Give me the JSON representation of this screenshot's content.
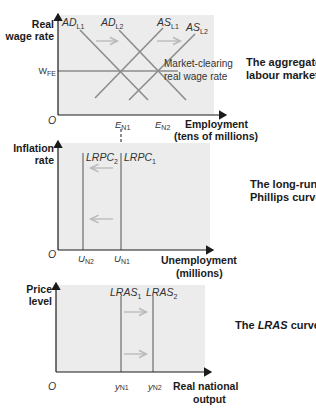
{
  "panels": [
    {
      "title_lines": [
        "The aggregate",
        "labour market"
      ],
      "y_axis_label": [
        "Real",
        "wage rate"
      ],
      "x_axis_label": [
        "Employment",
        "(tens of millions)"
      ],
      "origin": "O",
      "y_tick": {
        "main": "W",
        "sub": "FE"
      },
      "x_ticks": [
        {
          "main": "E",
          "sub": "N1"
        },
        {
          "main": "E",
          "sub": "N2"
        }
      ],
      "curves": [
        {
          "main": "AD",
          "sub": "L1"
        },
        {
          "main": "AD",
          "sub": "L2"
        },
        {
          "main": "AS",
          "sub": "L1"
        },
        {
          "main": "AS",
          "sub": "L2"
        }
      ],
      "annotation": [
        "Market-clearing",
        "real wage rate"
      ]
    },
    {
      "title_lines": [
        "The long-run",
        "Phillips curve"
      ],
      "y_axis_label": [
        "Inflation",
        "rate"
      ],
      "x_axis_label": [
        "Unemployment",
        "(millions)"
      ],
      "origin": "O",
      "x_ticks": [
        {
          "main": "U",
          "sub": "N2"
        },
        {
          "main": "U",
          "sub": "N1"
        }
      ],
      "curves": [
        {
          "main": "LRPC",
          "sub": "2"
        },
        {
          "main": "LRPC",
          "sub": "1"
        }
      ]
    },
    {
      "title_lines": [
        "The ",
        "LRAS",
        " curve"
      ],
      "y_axis_label": [
        "Price",
        "level"
      ],
      "x_axis_label": [
        "Real national",
        "output"
      ],
      "origin": "O",
      "x_ticks": [
        {
          "main": "y",
          "sub": "N1"
        },
        {
          "main": "y",
          "sub": "N2"
        }
      ],
      "curves": [
        {
          "main": "LRAS",
          "sub": "1"
        },
        {
          "main": "LRAS",
          "sub": "2"
        }
      ]
    }
  ],
  "colors": {
    "panel_bg": "#ececec",
    "curve": "#8c8c8c",
    "arrow": "#b8b8b8",
    "axis": "#1a1a1a"
  }
}
